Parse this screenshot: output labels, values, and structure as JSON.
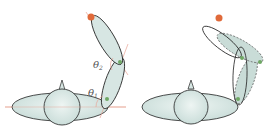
{
  "colors": {
    "fill": "#d7e6e3",
    "fill_light": "#e6efed",
    "stroke": "#222222",
    "ref_line": "#e8a596",
    "target": "#e06a3a",
    "joint": "#6fa865",
    "dashed_fill": "#c9dcd7"
  },
  "panels": [
    {
      "id": "left",
      "description": "Two-link arm on body with joint angles",
      "labels": {
        "theta1": "θ",
        "theta1_sub": "1",
        "theta2": "θ",
        "theta2_sub": "2"
      }
    },
    {
      "id": "right",
      "description": "Two-link arm alternate configurations (solid vs dashed)"
    }
  ]
}
